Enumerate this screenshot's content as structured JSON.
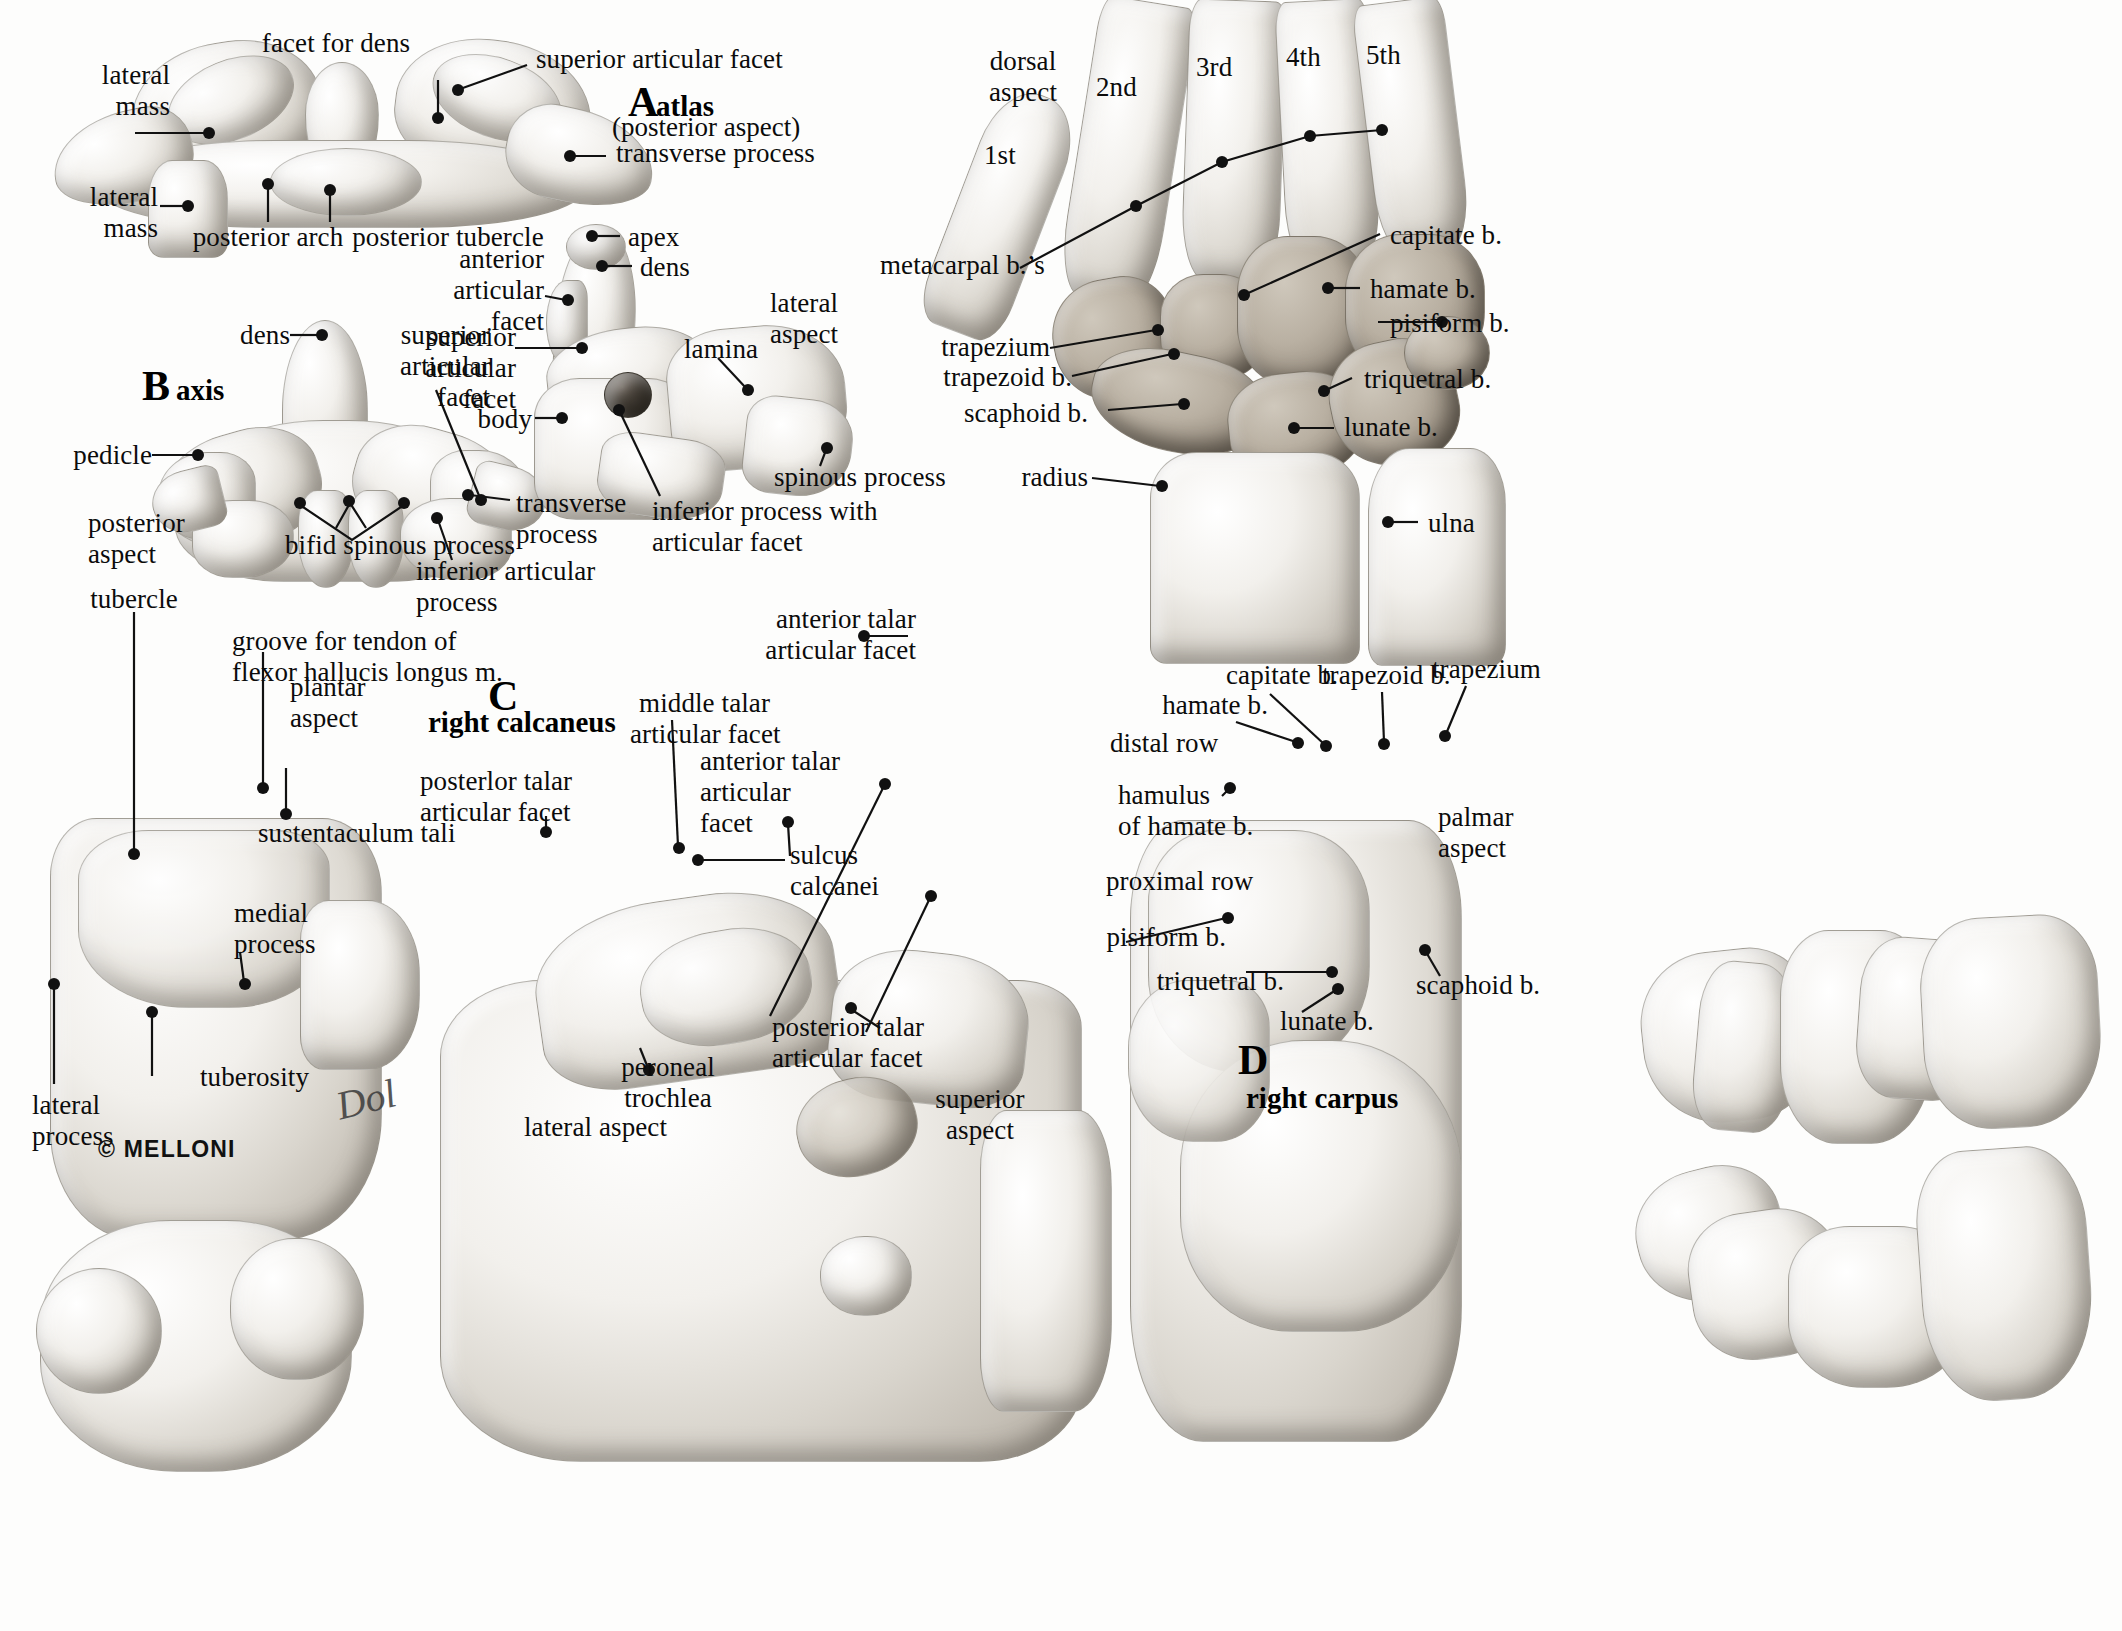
{
  "plate": {
    "title": "Vertebrae (atlas and axis), carpus and calcaneus — anatomical atlas plate",
    "copyright": "© MELLONI",
    "signature": "Dol"
  },
  "panels": {
    "a": {
      "letter": "A",
      "name": "atlas",
      "subtitle": "(posterior aspect)",
      "labels": [
        {
          "id": "lateral-mass-upper",
          "text": "lateral\nmass"
        },
        {
          "id": "facet-for-dens",
          "text": "facet for dens"
        },
        {
          "id": "superior-articular-facet",
          "text": "superior articular facet"
        },
        {
          "id": "transverse-process",
          "text": "transverse process"
        },
        {
          "id": "lateral-mass-lower",
          "text": "lateral\nmass"
        },
        {
          "id": "posterior-arch",
          "text": "posterior arch"
        },
        {
          "id": "posterior-tubercle",
          "text": "posterior tubercle"
        }
      ]
    },
    "b": {
      "letter": "B",
      "name": "axis",
      "labels": [
        {
          "id": "dens",
          "text": "dens"
        },
        {
          "id": "superior-articular-facet",
          "text": "superior\narticular\nfacet"
        },
        {
          "id": "pedicle",
          "text": "pedicle"
        },
        {
          "id": "posterior-aspect",
          "text": "posterior\naspect"
        },
        {
          "id": "bifid-spinous-process",
          "text": "bifid spinous process"
        },
        {
          "id": "transverse-process",
          "text": "transverse\nprocess"
        },
        {
          "id": "inferior-articular-process",
          "text": "inferior articular\nprocess"
        },
        {
          "id": "apex",
          "text": "apex"
        },
        {
          "id": "dens-lateral",
          "text": "dens"
        },
        {
          "id": "anterior-articular-facet",
          "text": "anterior\narticular\nfacet"
        },
        {
          "id": "superior-articular-facet-lateral",
          "text": "superior\narticular\nfacet"
        },
        {
          "id": "body",
          "text": "body"
        },
        {
          "id": "lamina",
          "text": "lamina"
        },
        {
          "id": "lateral-aspect",
          "text": "lateral\naspect"
        },
        {
          "id": "spinous-process",
          "text": "spinous process"
        },
        {
          "id": "inferior-process-articular-facet",
          "text": "inferior process with\narticular facet"
        }
      ]
    },
    "wrist": {
      "aspect": "dorsal\naspect",
      "metacarpal_numbers": [
        "1st",
        "2nd",
        "3rd",
        "4th",
        "5th"
      ],
      "labels": [
        {
          "id": "metacarpal-bones",
          "text": "metacarpal b.’s"
        },
        {
          "id": "capitate",
          "text": "capitate b."
        },
        {
          "id": "hamate",
          "text": "hamate b."
        },
        {
          "id": "pisiform",
          "text": "pisiform b."
        },
        {
          "id": "triquetral",
          "text": "triquetral b."
        },
        {
          "id": "lunate",
          "text": "lunate b."
        },
        {
          "id": "trapezium",
          "text": "trapezium"
        },
        {
          "id": "trapezoid",
          "text": "trapezoid b."
        },
        {
          "id": "scaphoid",
          "text": "scaphoid b."
        },
        {
          "id": "radius",
          "text": "radius"
        },
        {
          "id": "ulna",
          "text": "ulna"
        }
      ]
    },
    "c": {
      "letter": "C",
      "name": "right calcaneus",
      "labels": [
        {
          "id": "tubercle",
          "text": "tubercle"
        },
        {
          "id": "groove-flexor-hallucis",
          "text": "groove for tendon of\nflexor hallucis longus m."
        },
        {
          "id": "plantar-aspect",
          "text": "plantar\naspect"
        },
        {
          "id": "sustentaculum-tali",
          "text": "sustentaculum tali"
        },
        {
          "id": "medial-process",
          "text": "medial\nprocess"
        },
        {
          "id": "lateral-process",
          "text": "lateral\nprocess"
        },
        {
          "id": "tuberosity",
          "text": "tuberosity"
        },
        {
          "id": "posterior-talar-articular-facet-mid",
          "text": "posterlor talar\narticular facet"
        },
        {
          "id": "middle-talar-articular-facet",
          "text": "middle talar\narticular facet"
        },
        {
          "id": "anterior-talar-articular-facet-mid",
          "text": "anterior talar\narticular\nfacet"
        },
        {
          "id": "sulcus-calcanei",
          "text": "sulcus\ncalcanei"
        },
        {
          "id": "peroneal-trochlea",
          "text": "peroneal\ntrochlea"
        },
        {
          "id": "lateral-aspect",
          "text": "lateral aspect"
        },
        {
          "id": "anterior-talar-articular-facet-right",
          "text": "anterior talar\narticular facet"
        },
        {
          "id": "posterior-talar-articular-facet-right",
          "text": "posterior talar\narticular facet"
        },
        {
          "id": "superior-aspect",
          "text": "superior\naspect"
        }
      ]
    },
    "d": {
      "letter": "D",
      "name": "right carpus",
      "labels": [
        {
          "id": "hamate",
          "text": "hamate b."
        },
        {
          "id": "capitate",
          "text": "capitate b."
        },
        {
          "id": "trapezoid",
          "text": "trapezoid b."
        },
        {
          "id": "trapezium",
          "text": "trapezium"
        },
        {
          "id": "distal-row",
          "text": "distal row"
        },
        {
          "id": "hamulus-of-hamate",
          "text": "hamulus\nof hamate b."
        },
        {
          "id": "palmar-aspect",
          "text": "palmar\naspect"
        },
        {
          "id": "proximal-row",
          "text": "proximal row"
        },
        {
          "id": "pisiform",
          "text": "pisiform b."
        },
        {
          "id": "triquetral",
          "text": "triquetral b."
        },
        {
          "id": "lunate",
          "text": "lunate b."
        },
        {
          "id": "scaphoid",
          "text": "scaphoid b."
        }
      ]
    }
  }
}
